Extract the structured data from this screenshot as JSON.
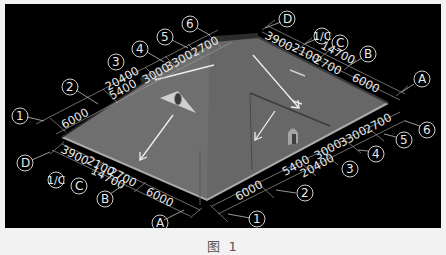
{
  "viewport": {
    "background": "#000000",
    "roof_color": "#6a6a6a",
    "roof_edge_color": "#a8a8a8",
    "arrow_color": "#f0f0f0"
  },
  "axes": {
    "numbered_top_left": [
      {
        "label": "1"
      },
      {
        "label": "2"
      },
      {
        "label": "3"
      },
      {
        "label": "4"
      },
      {
        "label": "5"
      },
      {
        "label": "6"
      }
    ],
    "numbered_bottom_right": [
      {
        "label": "1"
      },
      {
        "label": "2"
      },
      {
        "label": "3"
      },
      {
        "label": "4"
      },
      {
        "label": "5"
      },
      {
        "label": "6"
      }
    ],
    "lettered_top_right": [
      {
        "label": "D"
      },
      {
        "label": "1/C"
      },
      {
        "label": "C"
      },
      {
        "label": "B"
      },
      {
        "label": "A"
      }
    ],
    "lettered_bottom_left": [
      {
        "label": "D"
      },
      {
        "label": "1/C"
      },
      {
        "label": "C"
      },
      {
        "label": "B"
      },
      {
        "label": "A"
      }
    ]
  },
  "dimensions": {
    "top_left": {
      "segments": [
        "6000",
        "5400",
        "3000",
        "3300",
        "2700"
      ],
      "total": "20400"
    },
    "bottom_right": {
      "segments": [
        "6000",
        "5400",
        "3000",
        "3300",
        "2700"
      ],
      "total": "20400"
    },
    "top_right": {
      "segments": [
        "3900",
        "2100",
        "2700",
        "6000"
      ],
      "total": "14700"
    },
    "bottom_left": {
      "segments": [
        "3900",
        "2100",
        "2700",
        "6000"
      ],
      "total": "14700"
    }
  },
  "caption": {
    "text": "图 1"
  }
}
